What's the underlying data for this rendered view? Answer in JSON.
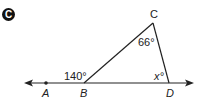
{
  "problem": {
    "badge": "C"
  },
  "diagram": {
    "points": {
      "A": "A",
      "B": "B",
      "C": "C",
      "D": "D"
    },
    "angles": {
      "exterior_B": "140°",
      "angle_C": "66°",
      "angle_D": "x°"
    },
    "colors": {
      "line": "#222222",
      "badge_bg": "#111111"
    }
  }
}
